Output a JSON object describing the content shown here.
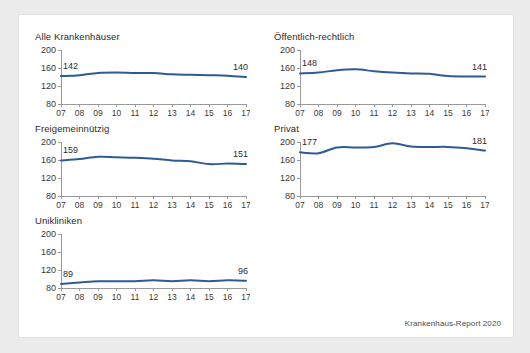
{
  "figure": {
    "source_note": "Krankenhaus-Report 2020",
    "line_color": "#2e5b96",
    "axis_color": "#9a9a9a",
    "background": "#ececec",
    "card_background": "#ffffff"
  },
  "chart_data": [
    {
      "type": "line",
      "title": "Alle Krankenhäuser",
      "xlabel": "",
      "ylabel": "",
      "categories": [
        "07",
        "08",
        "09",
        "10",
        "11",
        "12",
        "13",
        "14",
        "15",
        "16",
        "17"
      ],
      "values": [
        142,
        144,
        149,
        150,
        149,
        149,
        146,
        145,
        144,
        143,
        140
      ],
      "ylim": [
        80,
        200
      ],
      "yticks": [
        80,
        120,
        160,
        200
      ],
      "grid": false,
      "legend": "none",
      "annotations": [
        {
          "at": "07",
          "text": "142",
          "position": "left-top"
        },
        {
          "at": "17",
          "text": "140",
          "position": "right-top"
        }
      ]
    },
    {
      "type": "line",
      "title": "Öffentlich-rechtlich",
      "xlabel": "",
      "ylabel": "",
      "categories": [
        "07",
        "08",
        "09",
        "10",
        "11",
        "12",
        "13",
        "14",
        "15",
        "16",
        "17"
      ],
      "values": [
        148,
        150,
        155,
        157,
        153,
        150,
        148,
        147,
        142,
        141,
        141
      ],
      "ylim": [
        80,
        200
      ],
      "yticks": [
        80,
        120,
        160,
        200
      ],
      "grid": false,
      "legend": "none",
      "annotations": [
        {
          "at": "07",
          "text": "148",
          "position": "left-top"
        },
        {
          "at": "17",
          "text": "141",
          "position": "right-top"
        }
      ]
    },
    {
      "type": "line",
      "title": "Freigemeinnützig",
      "xlabel": "",
      "ylabel": "",
      "categories": [
        "07",
        "08",
        "09",
        "10",
        "11",
        "12",
        "13",
        "14",
        "15",
        "16",
        "17"
      ],
      "values": [
        159,
        162,
        167,
        166,
        165,
        163,
        159,
        157,
        151,
        152,
        151
      ],
      "ylim": [
        80,
        200
      ],
      "yticks": [
        80,
        120,
        160,
        200
      ],
      "grid": false,
      "legend": "none",
      "annotations": [
        {
          "at": "07",
          "text": "159",
          "position": "left-top"
        },
        {
          "at": "17",
          "text": "151",
          "position": "right-top"
        }
      ]
    },
    {
      "type": "line",
      "title": "Privat",
      "xlabel": "",
      "ylabel": "",
      "categories": [
        "07",
        "08",
        "09",
        "10",
        "11",
        "12",
        "13",
        "14",
        "15",
        "16",
        "17"
      ],
      "values": [
        177,
        175,
        188,
        188,
        189,
        197,
        190,
        189,
        189,
        186,
        181
      ],
      "ylim": [
        80,
        200
      ],
      "yticks": [
        80,
        120,
        160,
        200
      ],
      "grid": false,
      "legend": "none",
      "annotations": [
        {
          "at": "07",
          "text": "177",
          "position": "left-top"
        },
        {
          "at": "17",
          "text": "181",
          "position": "right-top"
        }
      ]
    },
    {
      "type": "line",
      "title": "Unikliniken",
      "xlabel": "",
      "ylabel": "",
      "categories": [
        "07",
        "08",
        "09",
        "10",
        "11",
        "12",
        "13",
        "14",
        "15",
        "16",
        "17"
      ],
      "values": [
        89,
        92,
        95,
        95,
        95,
        97,
        95,
        97,
        95,
        97,
        96
      ],
      "ylim": [
        80,
        200
      ],
      "yticks": [
        80,
        120,
        160,
        200
      ],
      "grid": false,
      "legend": "none",
      "annotations": [
        {
          "at": "07",
          "text": "89",
          "position": "left-top"
        },
        {
          "at": "17",
          "text": "96",
          "position": "right-top"
        }
      ]
    }
  ]
}
